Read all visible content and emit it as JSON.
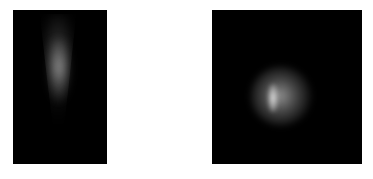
{
  "figure": {
    "panels": [
      {
        "id": "left",
        "description": "grayscale intensity image, elongated vertical streak tapering downward",
        "background_color": "#000000",
        "feature_color": "#b4b4b4",
        "caption_top": "",
        "caption_bottom": ""
      },
      {
        "id": "right",
        "description": "grayscale intensity image, round diffuse spot with bright core slightly left of center",
        "background_color": "#000000",
        "feature_color": "#e6e6e6",
        "caption_top": "",
        "caption_bottom": ""
      }
    ]
  }
}
